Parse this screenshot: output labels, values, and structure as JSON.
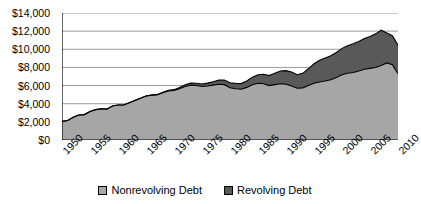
{
  "chart_data": {
    "type": "area",
    "stacked": true,
    "title": "",
    "xlabel": "",
    "ylabel": "",
    "ylim": [
      0,
      14000
    ],
    "xlim": [
      1950,
      2010
    ],
    "y_ticks": [
      0,
      2000,
      4000,
      6000,
      8000,
      10000,
      12000,
      14000
    ],
    "y_tick_labels": [
      "$0",
      "$2,000",
      "$4,000",
      "$6,000",
      "$8,000",
      "$10,000",
      "$12,000",
      "$14,000"
    ],
    "x_tick_labels": [
      "1950",
      "1955",
      "1960",
      "1965",
      "1970",
      "1975",
      "1980",
      "1985",
      "1990",
      "1995",
      "2000",
      "2005",
      "2010"
    ],
    "x_minor_tick_interval": 1,
    "grid": "horizontal",
    "legend_position": "bottom",
    "colors": {
      "nonrevolving": "#a6a6a6",
      "revolving": "#595959",
      "axis": "#000000",
      "gridline": "#808080",
      "background": "#ffffff"
    },
    "x": [
      1950,
      1951,
      1952,
      1953,
      1954,
      1955,
      1956,
      1957,
      1958,
      1959,
      1960,
      1961,
      1962,
      1963,
      1964,
      1965,
      1966,
      1967,
      1968,
      1969,
      1970,
      1971,
      1972,
      1973,
      1974,
      1975,
      1976,
      1977,
      1978,
      1979,
      1980,
      1981,
      1982,
      1983,
      1984,
      1985,
      1986,
      1987,
      1988,
      1989,
      1990,
      1991,
      1992,
      1993,
      1994,
      1995,
      1996,
      1997,
      1998,
      1999,
      2000,
      2001,
      2002,
      2003,
      2004,
      2005,
      2006,
      2007,
      2008,
      2009,
      2010
    ],
    "series": [
      {
        "name": "Nonrevolving Debt",
        "color": "#a6a6a6",
        "values": [
          2050,
          2150,
          2500,
          2750,
          2800,
          3150,
          3350,
          3450,
          3400,
          3750,
          3850,
          3850,
          4100,
          4350,
          4600,
          4850,
          4950,
          5000,
          5200,
          5400,
          5450,
          5650,
          5900,
          6050,
          6000,
          5900,
          5950,
          6050,
          6150,
          6100,
          5750,
          5650,
          5600,
          5800,
          6100,
          6250,
          6200,
          6000,
          6100,
          6200,
          6150,
          5950,
          5700,
          5750,
          6000,
          6250,
          6400,
          6500,
          6650,
          6900,
          7200,
          7350,
          7450,
          7600,
          7800,
          7900,
          8000,
          8200,
          8500,
          8300,
          7300
        ]
      },
      {
        "name": "Revolving Debt",
        "color": "#595959",
        "values": [
          0,
          0,
          0,
          0,
          0,
          0,
          0,
          0,
          0,
          0,
          0,
          0,
          0,
          0,
          0,
          0,
          0,
          0,
          50,
          80,
          100,
          130,
          180,
          230,
          260,
          280,
          320,
          380,
          450,
          520,
          560,
          590,
          620,
          700,
          820,
          950,
          1050,
          1100,
          1250,
          1400,
          1500,
          1550,
          1500,
          1600,
          1850,
          2150,
          2400,
          2550,
          2650,
          2750,
          2900,
          3050,
          3150,
          3250,
          3400,
          3500,
          3700,
          3900,
          3300,
          3200,
          3150
        ]
      }
    ]
  },
  "legend": {
    "items": [
      {
        "label": "Nonrevolving Debt",
        "color": "#a6a6a6"
      },
      {
        "label": "Revolving Debt",
        "color": "#595959"
      }
    ]
  }
}
